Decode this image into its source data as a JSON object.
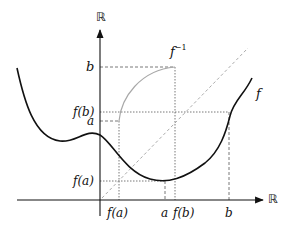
{
  "axes": {
    "x_label": "ℝ",
    "y_label": "ℝ"
  },
  "curves": {
    "f_label": "f",
    "f_inverse_label_base": "f",
    "f_inverse_label_sup": "−1"
  },
  "y_ticks": {
    "b": "b",
    "f_b": "f(b)",
    "a": "a",
    "f_a": "f(a)"
  },
  "x_ticks": {
    "f_a": "f(a)",
    "a": "a",
    "f_b": "f(b)",
    "b": "b"
  },
  "colors": {
    "axis": "#111111",
    "f_curve": "#111111",
    "f_inverse_curve": "#a8a8a8",
    "diagonal": "#a0a0a0",
    "guides": "#555555"
  }
}
